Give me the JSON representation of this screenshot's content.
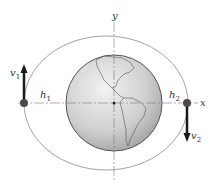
{
  "figure": {
    "axes": {
      "x_label": "x",
      "y_label": "y"
    },
    "points": [
      {
        "id": "perigee-left",
        "distance_label": "h",
        "distance_sub": "1",
        "velocity_label": "v",
        "velocity_sub": "1",
        "velocity_direction": "up"
      },
      {
        "id": "apogee-right",
        "distance_label": "h",
        "distance_sub": "2",
        "velocity_label": "v",
        "velocity_sub": "2",
        "velocity_direction": "down"
      }
    ],
    "central_body": "earth",
    "orbit": "elliptical",
    "colors": {
      "orbit": "#8a8a8a",
      "axis": "#7a7a7a",
      "earth_fill": "#c8c8c8",
      "earth_edge": "#555555",
      "arrow": "#1a1a1a",
      "dot": "#4a4a4a"
    }
  }
}
